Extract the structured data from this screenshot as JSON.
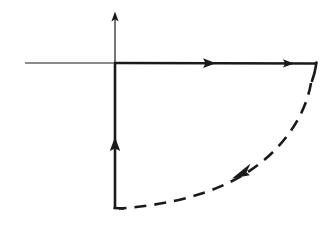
{
  "figure": {
    "kind": "contour-integration-diagram",
    "background_color": "#ffffff",
    "ink_color": "#1a1a1a",
    "canvas": {
      "width": 333,
      "height": 233
    }
  },
  "axes": {
    "origin": {
      "x": 115,
      "y": 63
    },
    "real_axis": {
      "name": "horizontal-axis",
      "from": {
        "x": 25,
        "y": 63
      },
      "to": {
        "x": 115,
        "y": 63
      },
      "stroke_width": 1.2,
      "has_arrowhead": false
    },
    "imaginary_axis": {
      "name": "vertical-axis",
      "from": {
        "x": 115,
        "y": 63
      },
      "to": {
        "x": 115,
        "y": 14
      },
      "stroke_width": 1.2,
      "has_arrowhead": true,
      "arrow_direction": "up"
    }
  },
  "contour": {
    "segments": [
      {
        "id": "top-ray",
        "label": "outward-segment",
        "style": "solid",
        "stroke_width": 2.6,
        "from": {
          "x": 115,
          "y": 63
        },
        "to": {
          "x": 316,
          "y": 63
        },
        "direction": "right",
        "arrowheads": [
          {
            "x": 212,
            "y": 63,
            "angle_deg": 0
          },
          {
            "x": 291,
            "y": 63,
            "angle_deg": 0
          }
        ]
      },
      {
        "id": "right-corner-stub",
        "label": "outer-radius-corner",
        "style": "solid",
        "stroke_width": 2.6,
        "from": {
          "x": 316,
          "y": 63
        },
        "to": {
          "x": 313,
          "y": 80
        },
        "direction": "down",
        "arrowheads": []
      },
      {
        "id": "dashed-arc",
        "label": "return-arc",
        "style": "dashed",
        "stroke_width": 2.6,
        "dash_length": 12,
        "gap_length": 8,
        "from": {
          "x": 313,
          "y": 80
        },
        "to": {
          "x": 118,
          "y": 208
        },
        "direction": "clockwise-inward",
        "arrowheads": [
          {
            "x": 243,
            "y": 171,
            "angle_deg": 215
          }
        ]
      },
      {
        "id": "vertical-return",
        "label": "inward-segment",
        "style": "solid",
        "stroke_width": 2.6,
        "from": {
          "x": 115,
          "y": 208
        },
        "to": {
          "x": 115,
          "y": 63
        },
        "direction": "up",
        "arrowheads": [
          {
            "x": 115,
            "y": 140,
            "angle_deg": 270
          }
        ]
      }
    ]
  }
}
